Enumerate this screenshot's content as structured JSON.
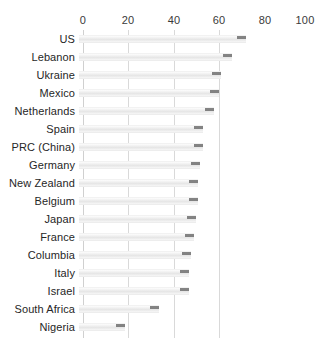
{
  "chart_data": {
    "type": "bar",
    "orientation": "horizontal",
    "title": "",
    "xlabel": "",
    "ylabel": "",
    "xlim": [
      0,
      100
    ],
    "xticks": [
      0,
      20,
      40,
      60,
      80,
      100
    ],
    "grid": true,
    "legend": false,
    "axis_position": "top",
    "categories": [
      "US",
      "Lebanon",
      "Ukraine",
      "Mexico",
      "Netherlands",
      "Spain",
      "PRC (China)",
      "Germany",
      "New Zealand",
      "Belgium",
      "Japan",
      "France",
      "Columbia",
      "Italy",
      "Israel",
      "South Africa",
      "Nigeria"
    ],
    "values": [
      73,
      67,
      62,
      61,
      59,
      54,
      54,
      53,
      52,
      52,
      51,
      50,
      49,
      48,
      48,
      35,
      20
    ],
    "colors": {
      "bar_fill": "#ededed",
      "bar_tip": "#6f6f6f",
      "gridline": "#d9d9d9",
      "text": "#262626",
      "background": "#ffffff"
    }
  }
}
